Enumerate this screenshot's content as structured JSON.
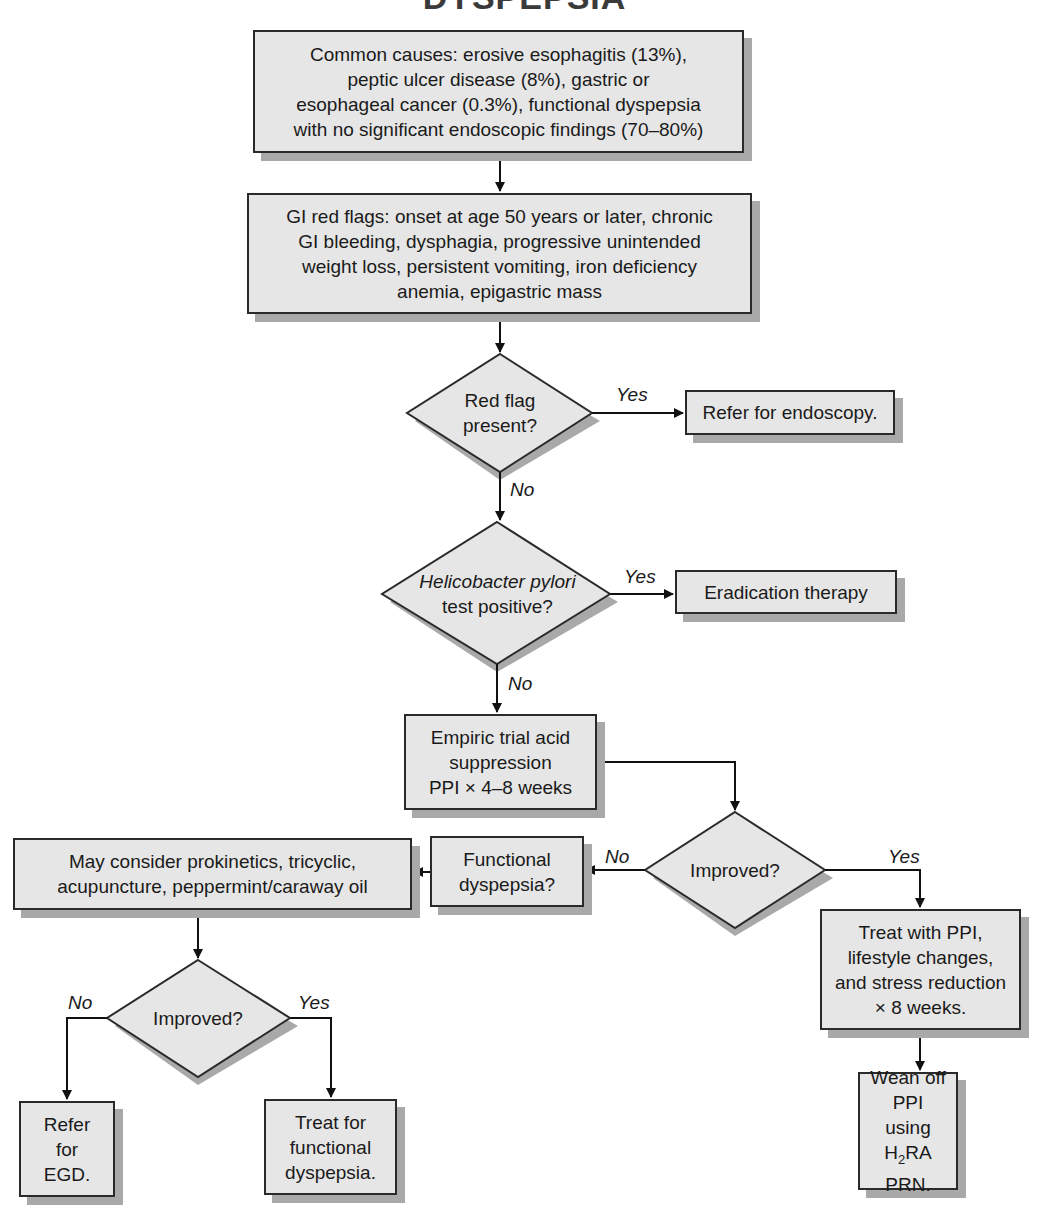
{
  "title": "DYSPEPSIA",
  "nodes": {
    "common_causes": "Common causes: erosive esophagitis (13%), peptic ulcer disease (8%), gastric or esophageal cancer (0.3%), functional dyspepsia with no significant endoscopic findings (70–80%)",
    "common_causes_lines": [
      "Common causes: erosive esophagitis (13%),",
      "peptic ulcer disease (8%), gastric or",
      "esophageal cancer (0.3%), functional dyspepsia",
      "with no significant endoscopic findings (70–80%)"
    ],
    "red_flags_lines": [
      "GI red flags: onset at age 50 years or later, chronic",
      "GI bleeding, dysphagia, progressive unintended",
      "weight loss, persistent vomiting, iron deficiency",
      "anemia, epigastric mass"
    ],
    "decision_red_flag_lines": [
      "Red flag",
      "present?"
    ],
    "refer_endoscopy": "Refer for endoscopy.",
    "decision_hpylori_lines": [
      "Helicobacter pylori",
      "test positive?"
    ],
    "eradication": "Eradication therapy",
    "empiric_lines": [
      "Empiric trial acid",
      "suppression",
      "PPI × 4–8 weeks"
    ],
    "decision_improved_1": "Improved?",
    "functional_lines": [
      "Functional",
      "dyspepsia?"
    ],
    "may_consider_lines": [
      "May consider prokinetics, tricyclic,",
      "acupuncture, peppermint/caraway oil"
    ],
    "treat_ppi_lines": [
      "Treat with PPI,",
      "lifestyle changes,",
      "and stress reduction",
      "× 8 weeks."
    ],
    "wean_lines": [
      "Wean off",
      "PPI using",
      "H",
      "2",
      "RA",
      "PRN."
    ],
    "decision_improved_2": "Improved?",
    "refer_egd_lines": [
      "Refer",
      "for",
      "EGD."
    ],
    "treat_functional_lines": [
      "Treat for",
      "functional",
      "dyspepsia."
    ]
  },
  "edge_labels": {
    "red_flag_yes": "Yes",
    "red_flag_no": "No",
    "hpylori_yes": "Yes",
    "hpylori_no": "No",
    "improved1_no": "No",
    "improved1_yes": "Yes",
    "improved2_no": "No",
    "improved2_yes": "Yes"
  },
  "colors": {
    "box_fill": "#e6e6e6",
    "box_border": "#2a2a2a",
    "shadow": "#a9a9a9"
  }
}
